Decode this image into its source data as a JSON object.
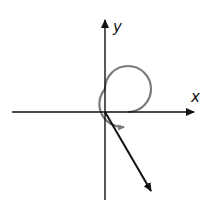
{
  "diagram": {
    "type": "angle-in-standard-position",
    "labels": {
      "x_axis": "x",
      "y_axis": "y"
    },
    "origin": [
      105,
      112
    ],
    "x_axis": {
      "from": [
        12,
        112
      ],
      "to": [
        196,
        112
      ]
    },
    "y_axis": {
      "from": [
        105,
        200
      ],
      "to": [
        105,
        18
      ]
    },
    "terminal_ray": {
      "from": [
        105,
        112
      ],
      "to": [
        152,
        193
      ]
    },
    "rotation_arc": {
      "center": [
        105,
        112
      ],
      "radius": 23,
      "direction": "counterclockwise",
      "color": "#7a7a7a"
    },
    "colors": {
      "axes": "#111111",
      "ray": "#111111",
      "arc": "#7a7a7a",
      "background": "#ffffff"
    }
  }
}
